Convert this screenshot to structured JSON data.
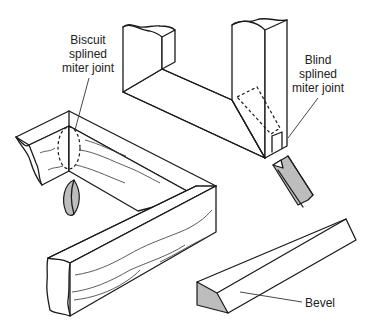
{
  "labels": {
    "biscuit": [
      "Biscuit",
      "splined",
      "miter joint"
    ],
    "blind": [
      "Blind",
      "splined",
      "miter joint"
    ],
    "bevel": "Bevel"
  },
  "colors": {
    "line": "#1a1a1a",
    "shade": "#bdbdbd",
    "background": "#ffffff"
  }
}
